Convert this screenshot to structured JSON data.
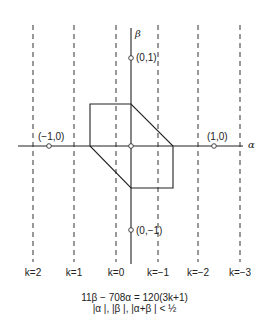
{
  "axes": {
    "x_label": "α",
    "y_label": "β"
  },
  "points": [
    {
      "label": "(0,1)",
      "x": 131,
      "y": 58
    },
    {
      "label": "(−1,0)",
      "x": 49,
      "y": 146
    },
    {
      "label": "(1,0)",
      "x": 214,
      "y": 146
    },
    {
      "label": "(0,−1)",
      "x": 131,
      "y": 230
    },
    {
      "label": "",
      "x": 131,
      "y": 146
    }
  ],
  "dashed_lines": [
    {
      "k_label": "k=2",
      "x": 33
    },
    {
      "k_label": "k=1",
      "x": 74
    },
    {
      "k_label": "k=0",
      "x": 116
    },
    {
      "k_label": "k=−1",
      "x": 158
    },
    {
      "k_label": "k=−2",
      "x": 198
    },
    {
      "k_label": "k=−3",
      "x": 240
    }
  ],
  "hexagon": [
    [
      90,
      104
    ],
    [
      131,
      104
    ],
    [
      173,
      146
    ],
    [
      173,
      188
    ],
    [
      131,
      188
    ],
    [
      90,
      146
    ]
  ],
  "equation": {
    "line1": "11β − 708α = 120(3k+1)",
    "line2": "|α |, |β |, |α+β | < ½"
  }
}
